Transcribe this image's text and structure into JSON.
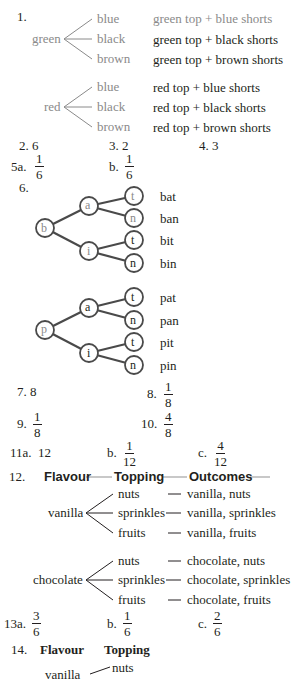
{
  "q1": {
    "number": "1.",
    "trees": [
      {
        "root": "green",
        "branches": [
          "blue",
          "black",
          "brown"
        ],
        "outcomes": [
          "green top + blue shorts",
          "green top + black shorts",
          "green top + brown shorts"
        ]
      },
      {
        "root": "red",
        "branches": [
          "blue",
          "black",
          "brown"
        ],
        "outcomes": [
          "red top + blue shorts",
          "red top + black shorts",
          "red top + brown shorts"
        ]
      }
    ]
  },
  "q2": {
    "number": "2.",
    "answer": "6"
  },
  "q3": {
    "number": "3.",
    "answer": "2"
  },
  "q4": {
    "number": "4.",
    "answer": "3"
  },
  "q5": {
    "a": {
      "label": "5a.",
      "num": "1",
      "den": "6"
    },
    "b": {
      "label": "b.",
      "num": "1",
      "den": "6"
    }
  },
  "q6": {
    "number": "6.",
    "trees": [
      {
        "root": "b",
        "mid": [
          "a",
          "i"
        ],
        "leaves": [
          "t",
          "n",
          "t",
          "n"
        ],
        "words": [
          "bat",
          "ban",
          "bit",
          "bin"
        ]
      },
      {
        "root": "p",
        "mid": [
          "a",
          "i"
        ],
        "leaves": [
          "t",
          "n",
          "t",
          "n"
        ],
        "words": [
          "pat",
          "pan",
          "pit",
          "pin"
        ]
      }
    ]
  },
  "q7": {
    "number": "7.",
    "answer": "8"
  },
  "q8": {
    "number": "8.",
    "num": "1",
    "den": "8"
  },
  "q9": {
    "number": "9.",
    "num": "1",
    "den": "8"
  },
  "q10": {
    "number": "10.",
    "num": "4",
    "den": "8"
  },
  "q11": {
    "a": {
      "label": "11a.",
      "answer": "12"
    },
    "b": {
      "label": "b.",
      "num": "1",
      "den": "12"
    },
    "c": {
      "label": "c.",
      "num": "4",
      "den": "12"
    }
  },
  "q12": {
    "number": "12.",
    "headers": [
      "Flavour",
      "Topping",
      "Outcomes"
    ],
    "trees": [
      {
        "root": "vanilla",
        "branches": [
          "nuts",
          "sprinkles",
          "fruits"
        ],
        "outcomes": [
          "vanilla, nuts",
          "vanilla, sprinkles",
          "vanilla, fruits"
        ]
      },
      {
        "root": "chocolate",
        "branches": [
          "nuts",
          "sprinkles",
          "fruits"
        ],
        "outcomes": [
          "chocolate, nuts",
          "chocolate, sprinkles",
          "chocolate, fruits"
        ]
      }
    ]
  },
  "q13": {
    "a": {
      "label": "13a.",
      "num": "3",
      "den": "6"
    },
    "b": {
      "label": "b.",
      "num": "1",
      "den": "6"
    },
    "c": {
      "label": "c.",
      "num": "2",
      "den": "6"
    }
  },
  "q14": {
    "number": "14.",
    "headers": [
      "Flavour",
      "Topping"
    ],
    "partial_root": "vanilla",
    "first_branch": "nuts"
  },
  "colors": {
    "text": "#231f20",
    "grey": "#8a8a8a",
    "line": "#4a4a4a"
  }
}
